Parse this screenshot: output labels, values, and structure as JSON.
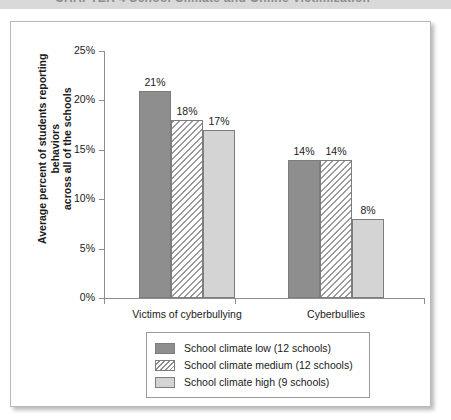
{
  "header": {
    "chapter_text": "CHAPTER 4   School Climate and Online Victimization"
  },
  "chart_data": {
    "type": "bar",
    "title": "",
    "xlabel": "",
    "ylabel": "Average percent of students reporting behaviors across all of the schools",
    "ylabel_line1": "Average percent of students reporting behaviors",
    "ylabel_line2": "across all of the schools",
    "categories": [
      "Victims of cyberbullying",
      "Cyberbullies"
    ],
    "series": [
      {
        "name": "School climate low (12 schools)",
        "key": "low",
        "values": [
          21,
          14
        ],
        "labels": [
          "21%",
          "14%"
        ],
        "color": "#8e8e8e",
        "fill": "solid-dark-gray"
      },
      {
        "name": "School climate medium (12 schools)",
        "key": "medium",
        "values": [
          18,
          14
        ],
        "labels": [
          "18%",
          "14%"
        ],
        "color": "#ffffff",
        "fill": "diagonal-hatch"
      },
      {
        "name": "School climate high (9 schools)",
        "key": "high",
        "values": [
          17,
          8
        ],
        "labels": [
          "17%",
          "8%"
        ],
        "color": "#d4d4d4",
        "fill": "solid-light-gray"
      }
    ],
    "ylim": [
      0,
      25
    ],
    "yticks": [
      0,
      5,
      10,
      15,
      20,
      25
    ],
    "ytick_labels": [
      "0%",
      "5%",
      "10%",
      "15%",
      "20%",
      "25%"
    ],
    "grid": false,
    "legend_position": "bottom-center"
  },
  "legend": {
    "entries": [
      {
        "label": "School climate low (12 schools)",
        "key": "low"
      },
      {
        "label": "School climate medium (12 schools)",
        "key": "medium"
      },
      {
        "label": "School climate high (9 schools)",
        "key": "high"
      }
    ]
  }
}
